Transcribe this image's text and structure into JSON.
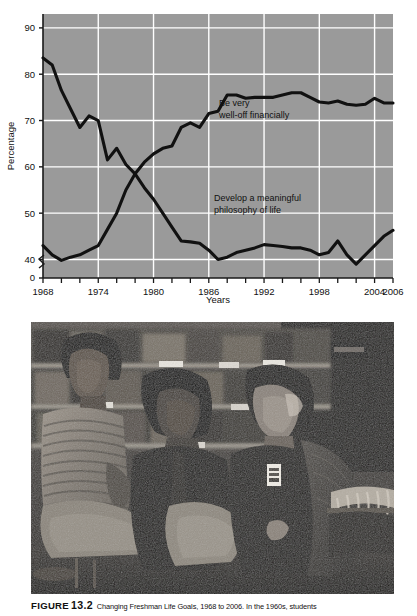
{
  "figure": {
    "label": "FIGURE",
    "number": "13.2",
    "caption": "Changing Freshman Life Goals, 1968 to 2006. In the 1960s, students"
  },
  "chart_data": {
    "type": "line",
    "title": "",
    "xlabel": "Years",
    "ylabel": "Percentage",
    "xlim": [
      1968,
      2006
    ],
    "ylim": [
      36,
      93
    ],
    "y_axis_break": true,
    "y_break_label": "0",
    "yticks": [
      0,
      40,
      50,
      60,
      70,
      80,
      90
    ],
    "ytick_labels": [
      "0",
      "40",
      "50",
      "60",
      "70",
      "80",
      "90"
    ],
    "xticks": [
      1968,
      1970,
      1972,
      1974,
      1976,
      1978,
      1980,
      1982,
      1984,
      1986,
      1988,
      1990,
      1992,
      1994,
      1996,
      1998,
      2000,
      2002,
      2004,
      2006
    ],
    "xtick_labels": [
      "1968",
      "1974",
      "1980",
      "1986",
      "1992",
      "1998",
      "2004",
      "2006"
    ],
    "xtick_label_years": [
      1968,
      1974,
      1980,
      1986,
      1992,
      1998,
      2004,
      2006
    ],
    "grid": true,
    "grid_color": "#ffffff",
    "plot_background": "#9a9a9a",
    "line_color": "#111111",
    "legend_position": "inline-annotation",
    "x": [
      1968,
      1969,
      1970,
      1971,
      1972,
      1973,
      1974,
      1975,
      1976,
      1977,
      1978,
      1979,
      1980,
      1981,
      1982,
      1983,
      1984,
      1985,
      1986,
      1987,
      1988,
      1989,
      1990,
      1991,
      1992,
      1993,
      1994,
      1995,
      1996,
      1997,
      1998,
      1999,
      2000,
      2001,
      2002,
      2003,
      2004,
      2005,
      2006
    ],
    "series": [
      {
        "name": "Develop a meaningful philosophy of life",
        "annotation": "Develop a meaningful\nphilosophy of life",
        "annotation_line_1": "Develop a meaningful",
        "annotation_line_2": "philosophy of life",
        "values": [
          83.5,
          82.0,
          76.5,
          72.5,
          68.5,
          71.0,
          70.0,
          61.5,
          64.0,
          60.5,
          58.5,
          55.5,
          53.0,
          50.0,
          47.0,
          44.0,
          43.8,
          43.5,
          42.0,
          40.0,
          40.5,
          41.5,
          42.0,
          42.5,
          43.2,
          43.0,
          42.8,
          42.5,
          42.5,
          42.0,
          41.0,
          41.5,
          44.0,
          41.0,
          39.0,
          41.0,
          43.0,
          45.0,
          46.3
        ]
      },
      {
        "name": "Be very well-off financially",
        "annotation": "Be very\nwell-off financially",
        "annotation_line_1": "Be very",
        "annotation_line_2": "well-off financially",
        "values": [
          43.0,
          41.0,
          39.8,
          40.5,
          41.0,
          42.0,
          43.0,
          46.5,
          50.0,
          55.0,
          58.5,
          61.0,
          62.8,
          64.0,
          64.5,
          68.5,
          69.5,
          68.5,
          71.5,
          72.0,
          75.5,
          75.5,
          74.8,
          75.0,
          75.0,
          75.0,
          75.5,
          76.0,
          76.0,
          75.0,
          74.0,
          73.8,
          74.2,
          73.5,
          73.3,
          73.5,
          74.8,
          73.8,
          73.8
        ]
      }
    ]
  }
}
